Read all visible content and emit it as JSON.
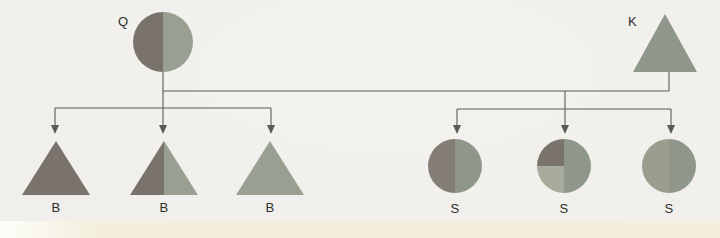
{
  "diagram": {
    "kind": "pedigree-cross-diagram",
    "parents": [
      {
        "label": "Q",
        "shape": "circle",
        "pattern": "left-half-dark / right-half-green"
      },
      {
        "label": "K",
        "shape": "triangle",
        "pattern": "solid-green"
      }
    ],
    "children": [
      {
        "label": "B",
        "shape": "triangle",
        "pattern": "solid-dark"
      },
      {
        "label": "B",
        "shape": "triangle",
        "pattern": "left-half-dark / right-half-green"
      },
      {
        "label": "B",
        "shape": "triangle",
        "pattern": "solid-green"
      },
      {
        "label": "S",
        "shape": "circle",
        "pattern": "left-half-dark / right-half-green"
      },
      {
        "label": "S",
        "shape": "circle",
        "pattern": "top-left-quarter-dark / bottom-left-quarter-light-green / right-half-green"
      },
      {
        "label": "S",
        "shape": "circle",
        "pattern": "left-half-light-olive / right-half-green"
      }
    ]
  },
  "colors": {
    "bg": "#f0efeb",
    "band": "#f2eedb",
    "dark": "#7a736c",
    "darkWarm": "#847d75",
    "green": "#8f968a",
    "greenSoft": "#99a092",
    "quarterLight": "#a8ac9c",
    "oliveLight": "#9b9d8e",
    "line": "#5b5a56",
    "label": "#2e2e2c"
  }
}
